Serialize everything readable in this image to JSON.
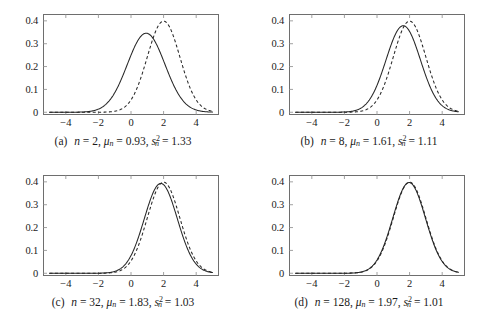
{
  "figure": {
    "panel_count": 4,
    "background_color": "#ffffff",
    "axis_color": "#6e6e6e",
    "curve_color": "#262626"
  },
  "chart_data": [
    {
      "type": "line",
      "panel_label": "(a)",
      "title": "",
      "xlabel": "",
      "ylabel": "",
      "xlim": [
        -5.4,
        5.4
      ],
      "ylim": [
        -0.012,
        0.43
      ],
      "xticks": [
        -4,
        -2,
        0,
        2,
        4
      ],
      "xtick_labels": [
        "−4",
        "−2",
        "0",
        "2",
        "4"
      ],
      "yticks": [
        0,
        0.1,
        0.2,
        0.3,
        0.4
      ],
      "ytick_labels": [
        "0",
        "0.1",
        "0.2",
        "0.3",
        "0.4"
      ],
      "grid": false,
      "legend": "none",
      "caption": {
        "tag": "(a)",
        "n_symbol": "n",
        "n_value": "2",
        "mu_symbol": "μ",
        "mu_sub": "n",
        "mu_value": "0.93",
        "s_symbol": "s",
        "s_sub": "n",
        "s_sup": "2",
        "s_value": "1.33",
        "text": "(a)  n = 2, μₙ = 0.93, s²ₙ = 1.33"
      },
      "series": [
        {
          "name": "posterior",
          "style": "solid",
          "distribution": "normal",
          "mean": 0.93,
          "variance": 1.33,
          "peak_value": 0.346
        },
        {
          "name": "reference",
          "style": "dashed",
          "distribution": "normal",
          "mean": 2.0,
          "variance": 1.0,
          "peak_value": 0.399
        }
      ]
    },
    {
      "type": "line",
      "panel_label": "(b)",
      "title": "",
      "xlabel": "",
      "ylabel": "",
      "xlim": [
        -5.4,
        5.4
      ],
      "ylim": [
        -0.012,
        0.43
      ],
      "xticks": [
        -4,
        -2,
        0,
        2,
        4
      ],
      "xtick_labels": [
        "−4",
        "−2",
        "0",
        "2",
        "4"
      ],
      "yticks": [
        0,
        0.1,
        0.2,
        0.3,
        0.4
      ],
      "ytick_labels": [
        "0",
        "0.1",
        "0.2",
        "0.3",
        "0.4"
      ],
      "grid": false,
      "legend": "none",
      "caption": {
        "tag": "(b)",
        "n_symbol": "n",
        "n_value": "8",
        "mu_symbol": "μ",
        "mu_sub": "n",
        "mu_value": "1.61",
        "s_symbol": "s",
        "s_sub": "n",
        "s_sup": "2",
        "s_value": "1.11",
        "text": "(b)  n = 8, μₙ = 1.61, s²ₙ = 1.11"
      },
      "series": [
        {
          "name": "posterior",
          "style": "solid",
          "distribution": "normal",
          "mean": 1.61,
          "variance": 1.11,
          "peak_value": 0.379
        },
        {
          "name": "reference",
          "style": "dashed",
          "distribution": "normal",
          "mean": 2.0,
          "variance": 1.0,
          "peak_value": 0.399
        }
      ]
    },
    {
      "type": "line",
      "panel_label": "(c)",
      "title": "",
      "xlabel": "",
      "ylabel": "",
      "xlim": [
        -5.4,
        5.4
      ],
      "ylim": [
        -0.012,
        0.43
      ],
      "xticks": [
        -4,
        -2,
        0,
        2,
        4
      ],
      "xtick_labels": [
        "−4",
        "−2",
        "0",
        "2",
        "4"
      ],
      "yticks": [
        0,
        0.1,
        0.2,
        0.3,
        0.4
      ],
      "ytick_labels": [
        "0",
        "0.1",
        "0.2",
        "0.3",
        "0.4"
      ],
      "grid": false,
      "legend": "none",
      "caption": {
        "tag": "(c)",
        "n_symbol": "n",
        "n_value": "32",
        "mu_symbol": "μ",
        "mu_sub": "n",
        "mu_value": "1.83",
        "s_symbol": "s",
        "s_sub": "n",
        "s_sup": "2",
        "s_value": "1.03",
        "text": "(c)  n = 32, μₙ = 1.83, s²ₙ = 1.03"
      },
      "series": [
        {
          "name": "posterior",
          "style": "solid",
          "distribution": "normal",
          "mean": 1.83,
          "variance": 1.03,
          "peak_value": 0.393
        },
        {
          "name": "reference",
          "style": "dashed",
          "distribution": "normal",
          "mean": 2.0,
          "variance": 1.0,
          "peak_value": 0.399
        }
      ]
    },
    {
      "type": "line",
      "panel_label": "(d)",
      "title": "",
      "xlabel": "",
      "ylabel": "",
      "xlim": [
        -5.4,
        5.4
      ],
      "ylim": [
        -0.012,
        0.43
      ],
      "xticks": [
        -4,
        -2,
        0,
        2,
        4
      ],
      "xtick_labels": [
        "−4",
        "−2",
        "0",
        "2",
        "4"
      ],
      "yticks": [
        0,
        0.1,
        0.2,
        0.3,
        0.4
      ],
      "ytick_labels": [
        "0",
        "0.1",
        "0.2",
        "0.3",
        "0.4"
      ],
      "grid": false,
      "legend": "none",
      "caption": {
        "tag": "(d)",
        "n_symbol": "n",
        "n_value": "128",
        "mu_symbol": "μ",
        "mu_sub": "n",
        "mu_value": "1.97",
        "s_symbol": "s",
        "s_sub": "n",
        "s_sup": "2",
        "s_value": "1.01",
        "text": "(d)  n = 128, μₙ = 1.97, s²ₙ = 1.01"
      },
      "series": [
        {
          "name": "posterior",
          "style": "solid",
          "distribution": "normal",
          "mean": 1.97,
          "variance": 1.01,
          "peak_value": 0.397
        },
        {
          "name": "reference",
          "style": "dashed",
          "distribution": "normal",
          "mean": 2.0,
          "variance": 1.0,
          "peak_value": 0.399
        }
      ]
    }
  ]
}
